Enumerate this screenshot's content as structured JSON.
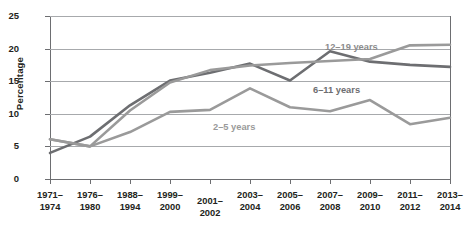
{
  "chart_data": {
    "type": "line",
    "title": "",
    "xlabel": "",
    "ylabel": "Percentage",
    "ylim": [
      0,
      25
    ],
    "yticks": [
      0,
      5,
      10,
      15,
      20,
      25
    ],
    "ytick_labels": [
      "0",
      "5",
      "10",
      "15",
      "20",
      "25"
    ],
    "grid": true,
    "legend_position": "inline-labels",
    "categories": [
      "1971–1974",
      "1976–1980",
      "1988–1994",
      "1999–2000",
      "2001–2002",
      "2003–2004",
      "2005–2006",
      "2007–2008",
      "2009–2010",
      "2011–2012",
      "2013–2014"
    ],
    "category_lines": [
      [
        "1971–",
        "1974"
      ],
      [
        "1976–",
        "1980"
      ],
      [
        "1988–",
        "1994"
      ],
      [
        "1999–",
        "2000"
      ],
      [
        "2001–",
        "2002"
      ],
      [
        "2003–",
        "2004"
      ],
      [
        "2005–",
        "2006"
      ],
      [
        "2007–",
        "2008"
      ],
      [
        "2009–",
        "2010"
      ],
      [
        "2011–",
        "2012"
      ],
      [
        "2013–",
        "2014"
      ]
    ],
    "series": [
      {
        "name": "2–5 years",
        "color": "#9a9a9a",
        "values": [
          6.1,
          5.0,
          7.2,
          10.3,
          10.6,
          13.9,
          11.0,
          10.4,
          12.1,
          8.4,
          9.4
        ]
      },
      {
        "name": "6–11 years",
        "color": "#6d6e71",
        "values": [
          4.0,
          6.5,
          11.3,
          15.1,
          16.3,
          17.7,
          15.1,
          19.6,
          18.0,
          17.5,
          17.2
        ]
      },
      {
        "name": "12–19 years",
        "color": "#9a9a9a",
        "values": [
          6.1,
          5.0,
          10.5,
          14.8,
          16.7,
          17.4,
          17.8,
          18.1,
          18.4,
          20.5,
          20.6
        ]
      }
    ],
    "series_labels": [
      {
        "text": "12–19 years",
        "series": "12–19 years"
      },
      {
        "text": "6–11 years",
        "series": "6–11 years"
      },
      {
        "text": "2–5 years",
        "series": "2–5 years"
      }
    ]
  }
}
